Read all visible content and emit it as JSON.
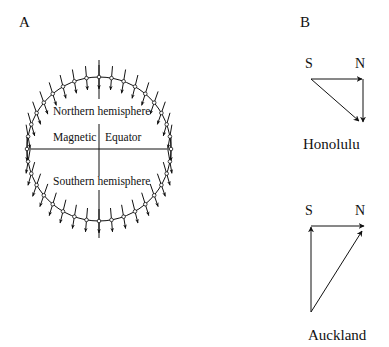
{
  "panel_a": {
    "label": "A",
    "northern_label": "Northern hemisphere",
    "southern_label": "Southern hemisphere",
    "equator_left": "Magnetic",
    "equator_right": "Equator",
    "circle": {
      "cx": 99,
      "cy": 149,
      "r": 72,
      "node_step_deg": 10,
      "vector_length": 24
    }
  },
  "panel_b": {
    "label": "B",
    "honolulu": {
      "city": "Honolulu",
      "south_label": "S",
      "north_label": "N"
    },
    "auckland": {
      "city": "Auckland",
      "south_label": "S",
      "north_label": "N"
    }
  },
  "colors": {
    "ink": "#111111",
    "background": "#ffffff"
  }
}
